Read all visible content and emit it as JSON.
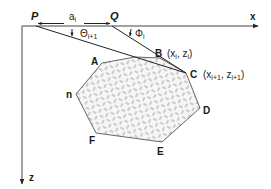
{
  "diagram": {
    "axes": {
      "x_label": "x",
      "z_label": "z"
    },
    "points": {
      "P": "P",
      "Q": "Q"
    },
    "distance_label": {
      "base": "a",
      "sub": "i"
    },
    "angles": {
      "theta": {
        "base": "Θ",
        "sub": "i+1"
      },
      "phi": {
        "base": "Φ",
        "sub": "i"
      }
    },
    "vertices": {
      "A": "A",
      "B": "B",
      "C": "C",
      "D": "D",
      "E": "E",
      "F": "F",
      "n": "n"
    },
    "coordinates": {
      "B": {
        "open": "(x",
        "sub1": "i",
        "mid": ", z",
        "sub2": "i",
        "close": ")"
      },
      "C": {
        "open": "(x",
        "sub1": "i+1",
        "mid": ", z",
        "sub2": "i+1",
        "close": ")"
      }
    },
    "colors": {
      "line": "#333333",
      "hatch": "#888888",
      "fill": "#f4f4f4"
    }
  }
}
